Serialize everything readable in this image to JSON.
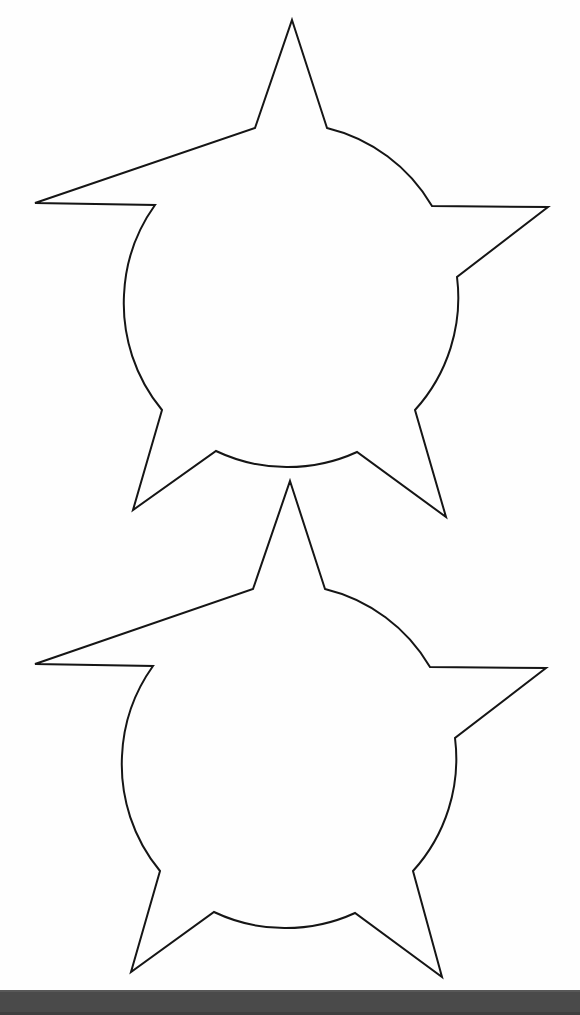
{
  "page": {
    "background_color": "#ffffff",
    "paper_color": "#fefefe",
    "width": 580,
    "height": 1015,
    "scan_artifact": "photocopy of printed craft template"
  },
  "ink": {
    "stroke_color": "#151515",
    "stroke_width": 2,
    "fill": "none"
  },
  "bottom_bar": {
    "label": "scanner edge bar",
    "color": "#4a4a4a",
    "highlight_color": "#585858",
    "shadow_color": "#3f3f3f",
    "top": 990,
    "height": 25
  },
  "shapes": [
    {
      "id": "star-circle-top",
      "name": "Star and circle outline (upper)",
      "type": "five-pointed-star-union-circle",
      "circle": {
        "cx": 290,
        "cy": 295,
        "r": 167
      },
      "points": {
        "apex": [
          292,
          20
        ],
        "left_point": [
          35,
          203
        ],
        "right_point": [
          548,
          207
        ],
        "lower_left_point": [
          133,
          510
        ],
        "lower_right_point": [
          446,
          517
        ]
      },
      "path": "M 292 20 L 327 128 A 167 167 0 0 1 432 206 L 548 207 L 457 277 A 167 167 0 0 1 415 410 L 446 517 L 357 452 A 167 167 0 0 1 216 451 L 133 510 L 162 410 A 167 167 0 0 1 124 295 A 167 167 0 0 1 155 205 L 35 203 L 255 128 Z"
    },
    {
      "id": "star-circle-bottom",
      "name": "Star and circle outline (lower)",
      "type": "five-pointed-star-union-circle",
      "circle": {
        "cx": 288,
        "cy": 756,
        "r": 167
      },
      "points": {
        "apex": [
          290,
          481
        ],
        "left_point": [
          35,
          664
        ],
        "right_point": [
          546,
          668
        ],
        "lower_left_point": [
          131,
          972
        ],
        "lower_right_point": [
          442,
          977
        ]
      },
      "path": "M 290 481 L 325 589 A 167 167 0 0 1 430 667 L 546 668 L 455 738 A 167 167 0 0 1 413 871 L 442 977 L 355 913 A 167 167 0 0 1 214 912 L 131 972 L 160 871 A 167 167 0 0 1 122 756 A 167 167 0 0 1 153 666 L 35 664 L 253 589 Z"
    }
  ]
}
